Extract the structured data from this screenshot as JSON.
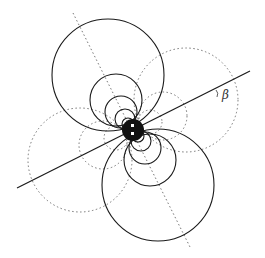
{
  "diagram": {
    "type": "dipole-field-lines",
    "angle_label": "β",
    "colors": {
      "solid": "#1a1a1a",
      "dotted": "#555555",
      "background": "#ffffff"
    },
    "center": [
      133,
      130
    ]
  }
}
